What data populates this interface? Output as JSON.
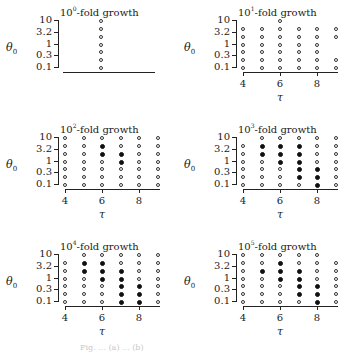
{
  "chart_data": [
    {
      "type": "scatter",
      "title": "10^0-fold growth",
      "title_base": "10",
      "title_exp": "0",
      "title_suffix": "-fold growth",
      "xlabel": "",
      "ylabel": "θ0",
      "yticks": [
        "10",
        "3.2",
        "1",
        "0.3",
        "0.1"
      ],
      "xticks": [],
      "x": [
        6
      ],
      "row_count": 7,
      "legend": {
        "open": "open circle",
        "filled": "filled circle"
      },
      "matrix": [
        [
          1,
          1,
          1,
          1,
          1,
          1,
          1
        ]
      ]
    },
    {
      "type": "scatter",
      "title": "10^1-fold growth",
      "title_base": "10",
      "title_exp": "1",
      "title_suffix": "-fold growth",
      "xlabel": "τ",
      "ylabel": "θ0",
      "yticks": [
        "10",
        "3.2",
        "1",
        "0.3",
        "0.1"
      ],
      "xticks": [
        "4",
        "6",
        "8"
      ],
      "x": [
        4,
        5,
        6,
        7,
        8,
        9
      ],
      "row_count": 7,
      "matrix": [
        [
          0,
          1,
          1,
          1,
          1,
          1,
          1
        ],
        [
          0,
          1,
          1,
          1,
          1,
          1,
          1
        ],
        [
          1,
          1,
          1,
          1,
          1,
          1,
          1
        ],
        [
          0,
          1,
          1,
          1,
          1,
          1,
          1
        ],
        [
          0,
          1,
          1,
          1,
          1,
          1,
          1
        ],
        [
          0,
          1,
          1,
          0,
          0,
          1,
          1
        ]
      ]
    },
    {
      "type": "scatter",
      "title": "10^2-fold growth",
      "title_base": "10",
      "title_exp": "2",
      "title_suffix": "-fold growth",
      "xlabel": "τ",
      "ylabel": "θ0",
      "yticks": [
        "10",
        "3.2",
        "1",
        "0.3",
        "0.1"
      ],
      "xticks": [
        "4",
        "6",
        "8"
      ],
      "x": [
        4,
        5,
        6,
        7,
        8,
        9
      ],
      "row_count": 7,
      "matrix": [
        [
          1,
          1,
          1,
          1,
          1,
          1,
          1
        ],
        [
          1,
          1,
          1,
          1,
          1,
          1,
          1
        ],
        [
          1,
          2,
          2,
          1,
          1,
          1,
          1
        ],
        [
          1,
          1,
          2,
          2,
          1,
          1,
          1
        ],
        [
          1,
          1,
          1,
          1,
          1,
          1,
          1
        ],
        [
          1,
          1,
          1,
          1,
          1,
          1,
          1
        ]
      ]
    },
    {
      "type": "scatter",
      "title": "10^3-fold growth",
      "title_base": "10",
      "title_exp": "3",
      "title_suffix": "-fold growth",
      "xlabel": "τ",
      "ylabel": "θ0",
      "yticks": [
        "10",
        "3.2",
        "1",
        "0.3",
        "0.1"
      ],
      "xticks": [
        "4",
        "6",
        "8"
      ],
      "x": [
        4,
        5,
        6,
        7,
        8,
        9
      ],
      "row_count": 7,
      "matrix": [
        [
          0,
          1,
          1,
          1,
          1,
          1,
          1
        ],
        [
          1,
          2,
          2,
          1,
          1,
          1,
          1
        ],
        [
          1,
          2,
          2,
          2,
          1,
          1,
          1
        ],
        [
          1,
          2,
          2,
          2,
          2,
          2,
          1
        ],
        [
          1,
          1,
          1,
          1,
          2,
          2,
          2
        ],
        [
          1,
          1,
          1,
          1,
          1,
          1,
          1
        ]
      ]
    },
    {
      "type": "scatter",
      "title": "10^4-fold growth",
      "title_base": "10",
      "title_exp": "4",
      "title_suffix": "-fold growth",
      "xlabel": "τ",
      "ylabel": "θ0",
      "yticks": [
        "10",
        "3.2",
        "1",
        "0.3",
        "0.1"
      ],
      "xticks": [
        "4",
        "6",
        "8"
      ],
      "x": [
        4,
        5,
        6,
        7,
        8,
        9
      ],
      "row_count": 7,
      "matrix": [
        [
          0,
          1,
          1,
          1,
          1,
          1,
          1
        ],
        [
          1,
          2,
          2,
          1,
          1,
          1,
          1
        ],
        [
          1,
          2,
          2,
          2,
          1,
          1,
          1
        ],
        [
          1,
          1,
          2,
          2,
          2,
          2,
          2
        ],
        [
          1,
          1,
          1,
          1,
          2,
          2,
          2
        ],
        [
          1,
          1,
          1,
          1,
          1,
          1,
          1
        ]
      ]
    },
    {
      "type": "scatter",
      "title": "10^5-fold growth",
      "title_base": "10",
      "title_exp": "5",
      "title_suffix": "-fold growth",
      "xlabel": "τ",
      "ylabel": "θ0",
      "yticks": [
        "10",
        "3.2",
        "1",
        "0.3",
        "0.1"
      ],
      "xticks": [
        "4",
        "6",
        "8"
      ],
      "x": [
        4,
        5,
        6,
        7,
        8,
        9
      ],
      "row_count": 7,
      "matrix": [
        [
          1,
          1,
          1,
          1,
          1,
          1,
          1
        ],
        [
          1,
          1,
          2,
          1,
          1,
          1,
          1
        ],
        [
          1,
          2,
          2,
          2,
          1,
          1,
          1
        ],
        [
          1,
          1,
          2,
          2,
          2,
          2,
          1
        ],
        [
          1,
          1,
          1,
          1,
          2,
          2,
          2
        ],
        [
          0,
          1,
          1,
          1,
          1,
          1,
          1
        ]
      ]
    }
  ],
  "caption": "Fig. ... (a)  ... (b)"
}
